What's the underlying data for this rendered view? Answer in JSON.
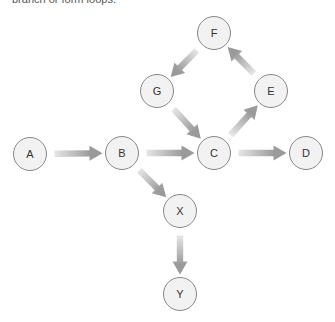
{
  "caption": "branch or form loops.",
  "diagram": {
    "node_style": {
      "fill": "#f2f2f2",
      "stroke": "#888888",
      "radius": 16.5
    },
    "arrow_style": {
      "tail_color": "#e6e6e6",
      "head_color": "#9a9a9a"
    },
    "nodes": [
      {
        "id": "A",
        "label": "A",
        "x": 30,
        "y": 154
      },
      {
        "id": "B",
        "label": "B",
        "x": 122,
        "y": 153
      },
      {
        "id": "C",
        "label": "C",
        "x": 214,
        "y": 153
      },
      {
        "id": "D",
        "label": "D",
        "x": 306,
        "y": 153
      },
      {
        "id": "E",
        "label": "E",
        "x": 271,
        "y": 91
      },
      {
        "id": "F",
        "label": "F",
        "x": 214,
        "y": 33
      },
      {
        "id": "G",
        "label": "G",
        "x": 157,
        "y": 91
      },
      {
        "id": "X",
        "label": "X",
        "x": 180,
        "y": 211
      },
      {
        "id": "Y",
        "label": "Y",
        "x": 180,
        "y": 294
      }
    ],
    "edges": [
      {
        "from": "A",
        "to": "B"
      },
      {
        "from": "B",
        "to": "C"
      },
      {
        "from": "C",
        "to": "D"
      },
      {
        "from": "C",
        "to": "E"
      },
      {
        "from": "E",
        "to": "F"
      },
      {
        "from": "F",
        "to": "G"
      },
      {
        "from": "G",
        "to": "C"
      },
      {
        "from": "B",
        "to": "X"
      },
      {
        "from": "X",
        "to": "Y"
      }
    ]
  }
}
